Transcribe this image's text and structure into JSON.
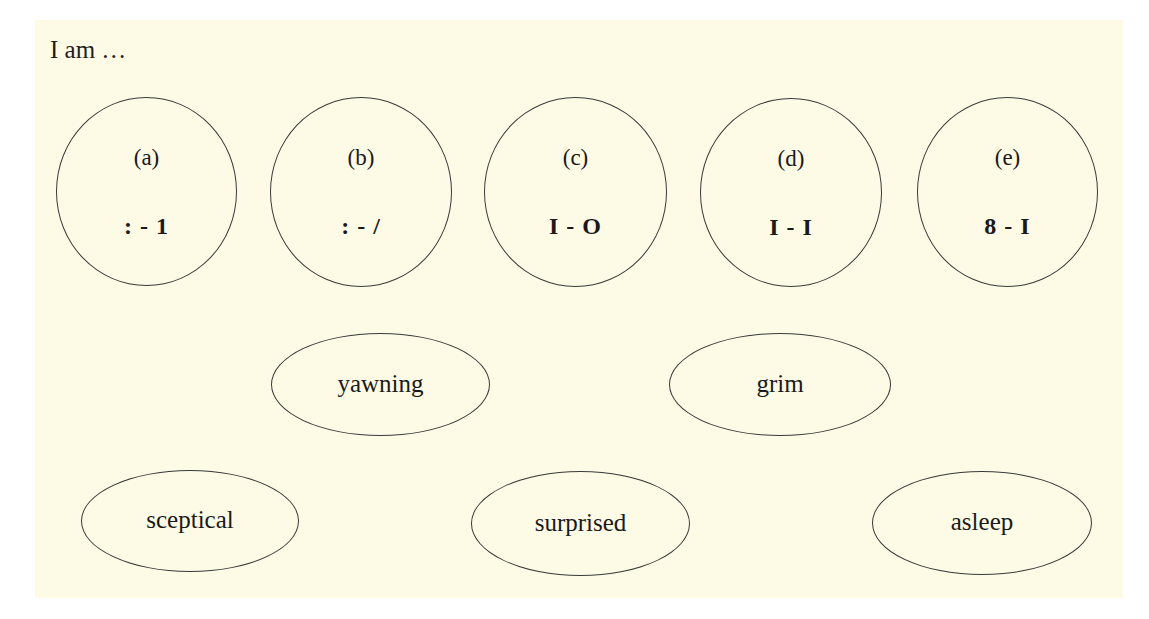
{
  "intro": "I am …",
  "colors": {
    "background": "#fdfbe6",
    "outline": "#3a3a3a",
    "text": "#1e1e1e"
  },
  "emoticons": [
    {
      "label": "(a)",
      "emoticon": ": - 1"
    },
    {
      "label": "(b)",
      "emoticon": ": - /"
    },
    {
      "label": "(c)",
      "emoticon": "I - O"
    },
    {
      "label": "(d)",
      "emoticon": "I - I"
    },
    {
      "label": "(e)",
      "emoticon": "8 - I"
    }
  ],
  "moods": [
    {
      "word": "yawning"
    },
    {
      "word": "grim"
    },
    {
      "word": "sceptical"
    },
    {
      "word": "surprised"
    },
    {
      "word": "asleep"
    }
  ]
}
